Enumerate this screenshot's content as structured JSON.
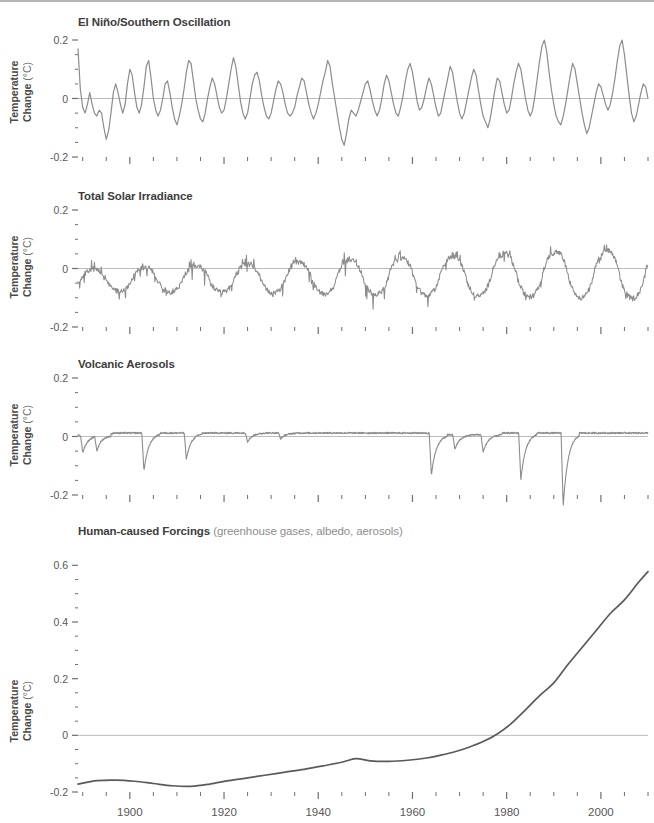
{
  "axis": {
    "ylabel_line1": "Temperature",
    "ylabel_line2": "Change",
    "ylabel_unit": "(°C)",
    "xticks_major": [
      1900,
      1920,
      1940,
      1960,
      1980,
      2000
    ],
    "xtick_labels": [
      "1900",
      "1920",
      "1940",
      "1960",
      "1980",
      "2000"
    ],
    "xlim": [
      1889,
      2010
    ],
    "xtick_minor_step": 5,
    "line_color": "#8c8c8c",
    "zero_line_color": "#bcbcbc",
    "text_color": "#575757"
  },
  "chart_data": [
    {
      "type": "line",
      "title": "El Niño/Southern Oscillation",
      "subtitle": "",
      "xlabel": "",
      "ylabel": "Temperature Change (°C)",
      "xlim": [
        1889,
        2010
      ],
      "ylim": [
        -0.2,
        0.2
      ],
      "yticks": [
        -0.2,
        0,
        0.2
      ],
      "ytick_labels": [
        "-0.2",
        "0",
        "0.2"
      ],
      "ytick_minor_step": 0.05,
      "grid": false,
      "legend": "none",
      "color": "#8c8c8c",
      "x": [
        1889,
        1889.5,
        1890,
        1890.5,
        1891,
        1891.5,
        1892,
        1892.5,
        1893,
        1893.5,
        1894,
        1894.5,
        1895,
        1895.5,
        1896,
        1896.5,
        1897,
        1897.5,
        1898,
        1898.5,
        1899,
        1899.5,
        1900,
        1900.5,
        1901,
        1901.5,
        1902,
        1902.5,
        1903,
        1903.5,
        1904,
        1904.5,
        1905,
        1905.5,
        1906,
        1906.5,
        1907,
        1907.5,
        1908,
        1908.5,
        1909,
        1909.5,
        1910,
        1910.5,
        1911,
        1911.5,
        1912,
        1912.5,
        1913,
        1913.5,
        1914,
        1914.5,
        1915,
        1915.5,
        1916,
        1916.5,
        1917,
        1917.5,
        1918,
        1918.5,
        1919,
        1919.5,
        1920,
        1920.5,
        1921,
        1921.5,
        1922,
        1922.5,
        1923,
        1923.5,
        1924,
        1924.5,
        1925,
        1925.5,
        1926,
        1926.5,
        1927,
        1927.5,
        1928,
        1928.5,
        1929,
        1929.5,
        1930,
        1930.5,
        1931,
        1931.5,
        1932,
        1932.5,
        1933,
        1933.5,
        1934,
        1934.5,
        1935,
        1935.5,
        1936,
        1936.5,
        1937,
        1937.5,
        1938,
        1938.5,
        1939,
        1939.5,
        1940,
        1940.5,
        1941,
        1941.5,
        1942,
        1942.5,
        1943,
        1943.5,
        1944,
        1944.5,
        1945,
        1945.5,
        1946,
        1946.5,
        1947,
        1947.5,
        1948,
        1948.5,
        1949,
        1949.5,
        1950,
        1950.5,
        1951,
        1951.5,
        1952,
        1952.5,
        1953,
        1953.5,
        1954,
        1954.5,
        1955,
        1955.5,
        1956,
        1956.5,
        1957,
        1957.5,
        1958,
        1958.5,
        1959,
        1959.5,
        1960,
        1960.5,
        1961,
        1961.5,
        1962,
        1962.5,
        1963,
        1963.5,
        1964,
        1964.5,
        1965,
        1965.5,
        1966,
        1966.5,
        1967,
        1967.5,
        1968,
        1968.5,
        1969,
        1969.5,
        1970,
        1970.5,
        1971,
        1971.5,
        1972,
        1972.5,
        1973,
        1973.5,
        1974,
        1974.5,
        1975,
        1975.5,
        1976,
        1976.5,
        1977,
        1977.5,
        1978,
        1978.5,
        1979,
        1979.5,
        1980,
        1980.5,
        1981,
        1981.5,
        1982,
        1982.5,
        1983,
        1983.5,
        1984,
        1984.5,
        1985,
        1985.5,
        1986,
        1986.5,
        1987,
        1987.5,
        1988,
        1988.5,
        1989,
        1989.5,
        1990,
        1990.5,
        1991,
        1991.5,
        1992,
        1992.5,
        1993,
        1993.5,
        1994,
        1994.5,
        1995,
        1995.5,
        1996,
        1996.5,
        1997,
        1997.5,
        1998,
        1998.5,
        1999,
        1999.5,
        2000,
        2000.5,
        2001,
        2001.5,
        2002,
        2002.5,
        2003,
        2003.5,
        2004,
        2004.5,
        2005,
        2005.5,
        2006,
        2006.5,
        2007,
        2007.5,
        2008,
        2008.5,
        2009,
        2009.5,
        2010
      ],
      "values": [
        0.17,
        0.03,
        -0.03,
        -0.05,
        -0.02,
        0.02,
        -0.02,
        -0.05,
        -0.06,
        -0.04,
        -0.05,
        -0.1,
        -0.14,
        -0.11,
        -0.05,
        0.02,
        0.05,
        0.02,
        -0.02,
        -0.05,
        -0.02,
        0.05,
        0.1,
        0.08,
        0.02,
        -0.03,
        -0.05,
        -0.02,
        0.04,
        0.11,
        0.13,
        0.07,
        0.0,
        -0.04,
        -0.06,
        -0.04,
        0.0,
        0.05,
        0.06,
        0.02,
        -0.03,
        -0.07,
        -0.09,
        -0.06,
        -0.02,
        0.03,
        0.09,
        0.13,
        0.12,
        0.06,
        0.0,
        -0.04,
        -0.07,
        -0.08,
        -0.05,
        0.0,
        0.04,
        0.07,
        0.05,
        0.01,
        -0.03,
        -0.05,
        -0.04,
        0.0,
        0.05,
        0.1,
        0.14,
        0.11,
        0.05,
        -0.01,
        -0.05,
        -0.07,
        -0.05,
        0.0,
        0.05,
        0.08,
        0.09,
        0.06,
        0.01,
        -0.03,
        -0.06,
        -0.07,
        -0.05,
        -0.01,
        0.03,
        0.06,
        0.05,
        0.02,
        -0.02,
        -0.05,
        -0.06,
        -0.05,
        -0.03,
        0.01,
        0.04,
        0.07,
        0.06,
        0.02,
        -0.02,
        -0.05,
        -0.07,
        -0.05,
        -0.02,
        0.02,
        0.06,
        0.09,
        0.13,
        0.11,
        0.05,
        0.0,
        -0.05,
        -0.1,
        -0.14,
        -0.16,
        -0.12,
        -0.07,
        -0.04,
        -0.05,
        -0.06,
        -0.04,
        -0.01,
        0.02,
        0.05,
        0.06,
        0.03,
        -0.01,
        -0.04,
        -0.06,
        -0.04,
        0.0,
        0.05,
        0.08,
        0.06,
        0.02,
        -0.02,
        -0.05,
        -0.06,
        -0.03,
        0.01,
        0.06,
        0.1,
        0.12,
        0.09,
        0.04,
        -0.01,
        -0.04,
        -0.03,
        0.0,
        0.04,
        0.07,
        0.05,
        0.01,
        -0.03,
        -0.06,
        -0.05,
        -0.01,
        0.03,
        0.07,
        0.11,
        0.09,
        0.04,
        -0.01,
        -0.05,
        -0.07,
        -0.05,
        -0.01,
        0.03,
        0.07,
        0.1,
        0.08,
        0.03,
        -0.02,
        -0.06,
        -0.08,
        -0.1,
        -0.07,
        -0.02,
        0.03,
        0.07,
        0.06,
        0.02,
        -0.02,
        -0.05,
        -0.04,
        0.0,
        0.05,
        0.09,
        0.12,
        0.1,
        0.05,
        0.0,
        -0.04,
        -0.06,
        -0.04,
        0.01,
        0.07,
        0.13,
        0.18,
        0.21,
        0.16,
        0.09,
        0.03,
        -0.02,
        -0.06,
        -0.08,
        -0.09,
        -0.06,
        -0.02,
        0.03,
        0.08,
        0.12,
        0.1,
        0.05,
        0.0,
        -0.05,
        -0.09,
        -0.12,
        -0.1,
        -0.06,
        -0.02,
        0.02,
        0.05,
        0.04,
        0.01,
        -0.02,
        -0.04,
        -0.02,
        0.02,
        0.07,
        0.13,
        0.18,
        0.21,
        0.15,
        0.08,
        0.01,
        -0.05,
        -0.08,
        -0.06,
        -0.02,
        0.02,
        0.05,
        0.04,
        0.0,
        -0.04,
        -0.06,
        -0.05,
        -0.02,
        0.02,
        0.05,
        0.07,
        0.05,
        0.01,
        -0.03,
        -0.06,
        -0.05,
        -0.02,
        0.02,
        0.06,
        0.08,
        0.06,
        0.02
      ]
    },
    {
      "type": "line",
      "title": "Total Solar Irradiance",
      "subtitle": "",
      "xlabel": "",
      "ylabel": "Temperature Change (°C)",
      "xlim": [
        1889,
        2010
      ],
      "ylim": [
        -0.2,
        0.2
      ],
      "yticks": [
        -0.2,
        0,
        0.2
      ],
      "ytick_labels": [
        "-0.2",
        "0",
        "0.2"
      ],
      "ytick_minor_step": 0.05,
      "grid": false,
      "legend": "none",
      "color": "#8c8c8c",
      "description": "Quasi-11-year solar cycle; amplitude grows after 1950",
      "cycle_peaks": [
        1893,
        1905,
        1917,
        1928,
        1937,
        1947,
        1958,
        1968,
        1979,
        1989,
        2000
      ],
      "cycle_troughs": [
        1889,
        1901,
        1913,
        1923,
        1933,
        1944,
        1954,
        1964,
        1976,
        1986,
        1996,
        2008
      ]
    },
    {
      "type": "line",
      "title": "Volcanic Aerosols",
      "subtitle": "",
      "xlabel": "",
      "ylabel": "Temperature Change (°C)",
      "xlim": [
        1889,
        2010
      ],
      "ylim": [
        -0.2,
        0.2
      ],
      "yticks": [
        -0.2,
        0,
        0.2
      ],
      "ytick_labels": [
        "-0.2",
        "0",
        "0.2"
      ],
      "ytick_minor_step": 0.05,
      "grid": false,
      "legend": "none",
      "color": "#8c8c8c",
      "eruptions": [
        {
          "year": 1890,
          "depth": -0.06
        },
        {
          "year": 1893,
          "depth": -0.05
        },
        {
          "year": 1903,
          "depth": -0.13
        },
        {
          "year": 1912,
          "depth": -0.09
        },
        {
          "year": 1925,
          "depth": -0.03
        },
        {
          "year": 1932,
          "depth": -0.02
        },
        {
          "year": 1964,
          "depth": -0.14
        },
        {
          "year": 1969,
          "depth": -0.05
        },
        {
          "year": 1975,
          "depth": -0.06
        },
        {
          "year": 1983,
          "depth": -0.16
        },
        {
          "year": 1992,
          "depth": -0.25
        }
      ]
    },
    {
      "type": "line",
      "title": "Human-caused Forcings",
      "subtitle": "(greenhouse gases, albedo, aerosols)",
      "xlabel": "",
      "ylabel": "Temperature Change (°C)",
      "xlim": [
        1889,
        2010
      ],
      "ylim": [
        -0.2,
        0.64
      ],
      "yticks": [
        -0.2,
        0,
        0.2,
        0.4,
        0.6
      ],
      "ytick_labels": [
        "-0.2",
        "0",
        "0.2",
        "0.4",
        "0.6"
      ],
      "ytick_minor_step": 0.05,
      "grid": false,
      "legend": "none",
      "color": "#5a5a5a",
      "x": [
        1889,
        1893,
        1897,
        1901,
        1905,
        1909,
        1913,
        1917,
        1921,
        1925,
        1929,
        1933,
        1937,
        1941,
        1945,
        1948,
        1951,
        1955,
        1959,
        1963,
        1966,
        1969,
        1972,
        1975,
        1978,
        1981,
        1984,
        1987,
        1990,
        1993,
        1996,
        1999,
        2002,
        2005,
        2008,
        2010
      ],
      "values": [
        -0.172,
        -0.16,
        -0.158,
        -0.162,
        -0.17,
        -0.178,
        -0.18,
        -0.172,
        -0.16,
        -0.15,
        -0.14,
        -0.13,
        -0.12,
        -0.108,
        -0.095,
        -0.082,
        -0.09,
        -0.092,
        -0.088,
        -0.08,
        -0.07,
        -0.058,
        -0.042,
        -0.022,
        0.005,
        0.042,
        0.09,
        0.14,
        0.185,
        0.25,
        0.31,
        0.37,
        0.43,
        0.478,
        0.54,
        0.578
      ]
    }
  ]
}
